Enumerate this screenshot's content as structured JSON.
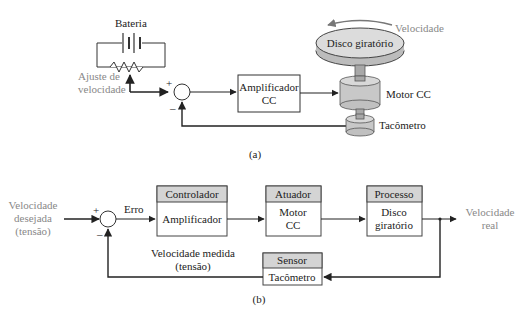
{
  "diagram_a": {
    "caption": "(a)",
    "battery_label": "Bateria",
    "pot_label_line1": "Ajuste de",
    "pot_label_line2": "velocidade",
    "sum_plus": "+",
    "sum_minus": "–",
    "amplifier_line1": "Amplificador",
    "amplifier_line2": "CC",
    "disk_label": "Disco giratório",
    "speed_label": "Velocidade",
    "motor_label": "Motor CC",
    "tacho_label": "Tacômetro"
  },
  "diagram_b": {
    "caption": "(b)",
    "input_line1": "Velocidade",
    "input_line2": "desejada",
    "input_line3": "(tensão)",
    "sum_plus": "+",
    "sum_minus": "–",
    "error_label": "Erro",
    "blocks": [
      {
        "header": "Controlador",
        "body_line1": "Amplificador",
        "body_line2": ""
      },
      {
        "header": "Atuador",
        "body_line1": "Motor",
        "body_line2": "CC"
      },
      {
        "header": "Processo",
        "body_line1": "Disco",
        "body_line2": "giratório"
      }
    ],
    "sensor": {
      "header": "Sensor",
      "body": "Tacômetro"
    },
    "feedback_line1": "Velocidade medida",
    "feedback_line2": "(tensão)",
    "output_line1": "Velocidade",
    "output_line2": "real"
  },
  "colors": {
    "line": "#222222",
    "header_fill": "#d4d4d4",
    "muted_text": "#888888",
    "device_fill": "#cfcfcf"
  }
}
